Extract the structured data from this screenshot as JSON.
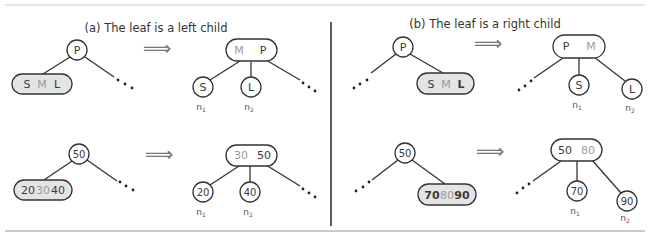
{
  "colors": {
    "line": "#333333",
    "leaf_fill": "#e4e4e4",
    "node_fill": "#ffffff",
    "text_dark": "#3a3a3a",
    "text_light": "#9a9a9a",
    "rule": "#cccccc"
  },
  "panels": {
    "a": {
      "caption": "(a) The leaf is a left child",
      "arrow": "⟹",
      "top": {
        "before": {
          "parent": "P",
          "leaf": [
            "S",
            "M",
            "L"
          ]
        },
        "after": {
          "parent": [
            "M",
            "P"
          ],
          "children": [
            "S",
            "L"
          ],
          "labels": [
            "n",
            "n"
          ],
          "subs": [
            "1",
            "2"
          ]
        }
      },
      "bottom": {
        "before": {
          "parent": "50",
          "leaf": [
            "20",
            "30",
            "40"
          ]
        },
        "after": {
          "parent": [
            "30",
            "50"
          ],
          "children": [
            "20",
            "40"
          ],
          "labels": [
            "n",
            "n"
          ],
          "subs": [
            "1",
            "2"
          ]
        }
      }
    },
    "b": {
      "caption": "(b) The leaf is a right child",
      "arrow": "⟹",
      "top": {
        "before": {
          "parent": "P",
          "leaf": [
            "S",
            "M",
            "L"
          ]
        },
        "after": {
          "parent": [
            "P",
            "M"
          ],
          "children": [
            "S",
            "L"
          ],
          "labels": [
            "n",
            "n"
          ],
          "subs": [
            "1",
            "2"
          ]
        }
      },
      "bottom": {
        "before": {
          "parent": "50",
          "leaf": [
            "70",
            "80",
            "90"
          ]
        },
        "after": {
          "parent": [
            "50",
            "80"
          ],
          "children": [
            "70",
            "90"
          ],
          "labels": [
            "n",
            "n"
          ],
          "subs": [
            "1",
            "2"
          ]
        }
      }
    }
  }
}
